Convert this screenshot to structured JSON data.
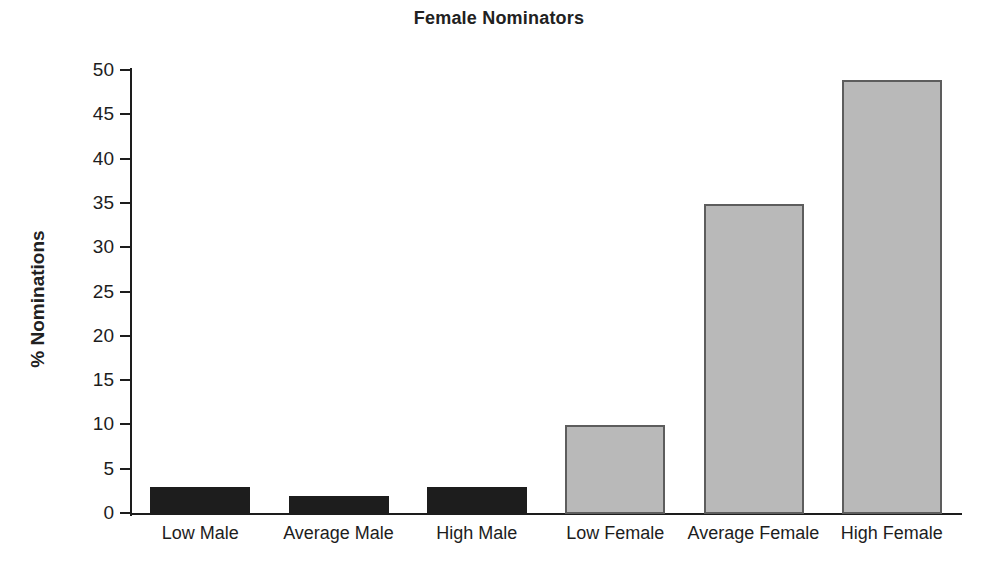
{
  "chart_data": {
    "type": "bar",
    "title": "Female Nominators",
    "xlabel": "",
    "ylabel": "% Nominations",
    "categories": [
      "Low Male",
      "Average Male",
      "High Male",
      "Low Female",
      "Average Female",
      "High Female"
    ],
    "values": [
      3,
      2,
      3,
      10,
      35,
      49
    ],
    "series": [
      {
        "name": "% Nominations",
        "values": [
          3,
          2,
          3,
          10,
          35,
          49
        ]
      }
    ],
    "ylim": [
      0,
      50
    ],
    "ytick_labels": [
      "0",
      "5",
      "10",
      "15",
      "20",
      "25",
      "30",
      "35",
      "40",
      "45",
      "50"
    ],
    "ytick_values": [
      0,
      5,
      10,
      15,
      20,
      25,
      30,
      35,
      40,
      45,
      50
    ],
    "grid": false,
    "legend": "none",
    "bar_colors": [
      "#1d1d1d",
      "#1d1d1d",
      "#1d1d1d",
      "#b9b9b9",
      "#b9b9b9",
      "#b9b9b9"
    ],
    "bar_edge_colors": [
      "#1d1d1d",
      "#1d1d1d",
      "#1d1d1d",
      "#5d5d5d",
      "#5d5d5d",
      "#5d5d5d"
    ],
    "colors": {
      "background": "#ffffff",
      "axis": "#1d1d1d",
      "text": "#1d1d1d",
      "male_bar": "#1d1d1d",
      "female_bar": "#b9b9b9"
    }
  }
}
